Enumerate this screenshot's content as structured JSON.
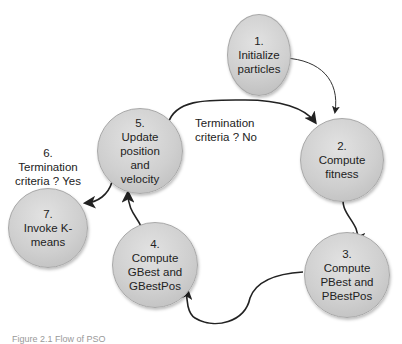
{
  "diagram": {
    "nodes": [
      {
        "id": "n1",
        "label": "1.\nInitialize\nparticles"
      },
      {
        "id": "n2",
        "label": "2.\nCompute\nfitness"
      },
      {
        "id": "n3",
        "label": "3.\nCompute\nPBest and\nPBestPos"
      },
      {
        "id": "n4",
        "label": "4.\nCompute\nGBest and\nGBestPos"
      },
      {
        "id": "n5",
        "label": "5.\nUpdate\nposition\nand\nvelocity"
      },
      {
        "id": "n7",
        "label": "7.\nInvoke K-\nmeans"
      }
    ],
    "edges": [
      {
        "from": "n1",
        "to": "n2",
        "label": ""
      },
      {
        "from": "n2",
        "to": "n3",
        "label": ""
      },
      {
        "from": "n3",
        "to": "n4",
        "label": ""
      },
      {
        "from": "n4",
        "to": "n5",
        "label": ""
      },
      {
        "from": "n5",
        "to": "n2",
        "label": "Termination\ncriteria ? No"
      },
      {
        "from": "n5",
        "to": "n7",
        "label": "6.\nTermination\ncriteria ? Yes"
      }
    ],
    "caption": "Figure 2.1 Flow of PSO"
  }
}
